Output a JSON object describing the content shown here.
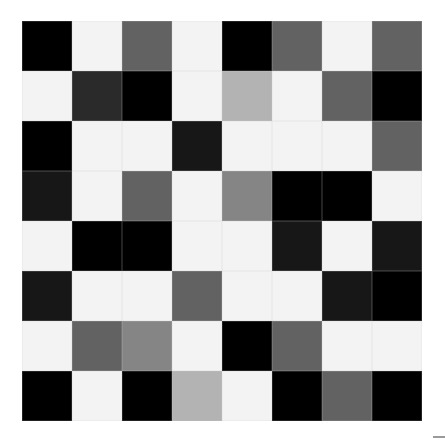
{
  "grid": {
    "rows": 8,
    "cols": 8,
    "cell_size_px": 50,
    "palette": {
      "K": "#000000",
      "N": "#171717",
      "D": "#2a2a2a",
      "G": "#626262",
      "M": "#858585",
      "L": "#b3b3b3",
      "W": "#f3f3f3"
    },
    "cells": [
      [
        "K",
        "W",
        "G",
        "W",
        "K",
        "G",
        "W",
        "G"
      ],
      [
        "W",
        "D",
        "K",
        "W",
        "L",
        "W",
        "G",
        "K"
      ],
      [
        "K",
        "W",
        "W",
        "N",
        "W",
        "W",
        "W",
        "G"
      ],
      [
        "N",
        "W",
        "G",
        "W",
        "M",
        "K",
        "K",
        "W"
      ],
      [
        "W",
        "K",
        "K",
        "W",
        "W",
        "N",
        "W",
        "N"
      ],
      [
        "N",
        "W",
        "W",
        "G",
        "W",
        "W",
        "N",
        "K"
      ],
      [
        "W",
        "G",
        "M",
        "W",
        "K",
        "G",
        "W",
        "W"
      ],
      [
        "K",
        "W",
        "K",
        "L",
        "W",
        "K",
        "G",
        "K"
      ]
    ]
  },
  "corner_mark": {
    "color": "#9a9a9a"
  }
}
